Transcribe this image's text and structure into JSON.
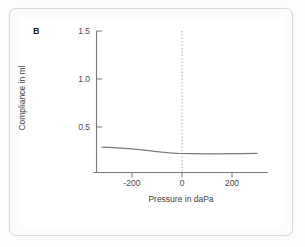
{
  "figure": {
    "panel_label": "B",
    "background_color": "#ffffff",
    "frame_color": "#d9d9d9"
  },
  "chart_data": {
    "type": "line",
    "title": "",
    "subtitle": "",
    "panel": "B",
    "xlabel": "Pressure in daPa",
    "ylabel": "Compliance in ml",
    "xlim": [
      -320,
      300
    ],
    "ylim": [
      0,
      1.5
    ],
    "xticks": [
      -200,
      0,
      200
    ],
    "xtick_labels": [
      "-200",
      "0",
      "200"
    ],
    "yticks": [
      0.5,
      1.0,
      1.5
    ],
    "ytick_labels": [
      "0.5",
      "1.0",
      "1.5"
    ],
    "grid": false,
    "legend": null,
    "line_color": "#7a7a7a",
    "axis_color": "#7a7a7a",
    "annotations": [
      {
        "name": "zero-pressure-reference",
        "type": "vline",
        "x": 0,
        "style": "dotted",
        "color": "#9a9a9a"
      }
    ],
    "series": [
      {
        "name": "Compliance",
        "x": [
          -320,
          -290,
          -260,
          -230,
          -200,
          -170,
          -140,
          -110,
          -80,
          -50,
          -20,
          0,
          40,
          90,
          140,
          190,
          240,
          300
        ],
        "values": [
          0.29,
          0.287,
          0.283,
          0.278,
          0.272,
          0.265,
          0.256,
          0.247,
          0.238,
          0.231,
          0.226,
          0.224,
          0.222,
          0.221,
          0.221,
          0.222,
          0.223,
          0.225
        ]
      }
    ]
  }
}
